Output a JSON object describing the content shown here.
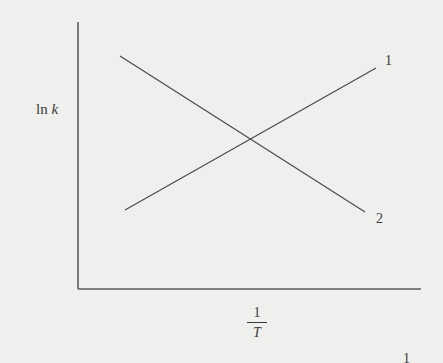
{
  "chart_data": {
    "type": "line",
    "title": "",
    "xlabel": "1/T",
    "ylabel": "ln k",
    "xlabel_parts": {
      "numerator": "1",
      "denominator": "T"
    },
    "ylabel_parts": {
      "fn": "ln",
      "var": "k"
    },
    "grid": false,
    "legend": "inline labels at line ends",
    "axis_ticks": "none",
    "x_range_px": [
      78,
      421
    ],
    "y_range_px": [
      22,
      289
    ],
    "series": [
      {
        "name": "1",
        "label": "1",
        "trend": "increasing",
        "points_px": [
          [
            125,
            210
          ],
          [
            376,
            68
          ]
        ]
      },
      {
        "name": "2",
        "label": "2",
        "trend": "decreasing",
        "points_px": [
          [
            120,
            56
          ],
          [
            365,
            212
          ]
        ]
      }
    ],
    "intersection_px": [
      249,
      138
    ],
    "annotations": [
      "1",
      "2"
    ]
  },
  "labels": {
    "y_fn": "ln",
    "y_var": "k",
    "x_num": "1",
    "x_den": "T",
    "series1": "1",
    "series2": "2",
    "edge_mark": "1"
  },
  "colors": {
    "background": "#efefed",
    "ink": "#3a3a3a"
  }
}
